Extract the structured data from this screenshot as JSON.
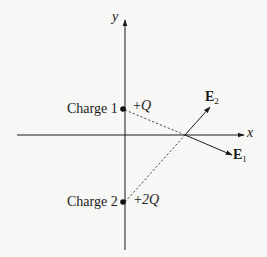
{
  "axes": {
    "x_label": "x",
    "y_label": "y"
  },
  "charges": [
    {
      "name": "Charge 1",
      "value_sign": "+",
      "value": "Q"
    },
    {
      "name": "Charge 2",
      "value_sign": "+",
      "value": "2Q"
    }
  ],
  "vectors": [
    {
      "symbol": "E",
      "subscript": "2"
    },
    {
      "symbol": "E",
      "subscript": "1"
    }
  ],
  "colors": {
    "ink": "#1a1a1a",
    "background": "#f7f7f5"
  }
}
